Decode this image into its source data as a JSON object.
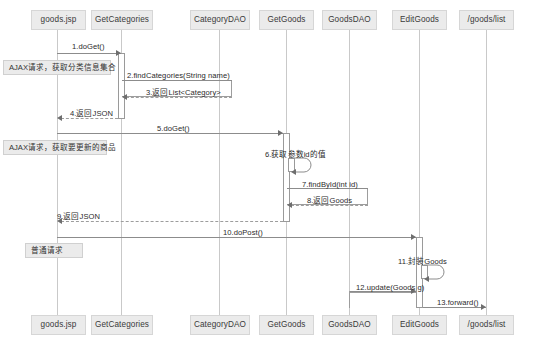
{
  "diagram": {
    "type": "uml-sequence-diagram",
    "colors": {
      "participant_fill": "#ebebeb",
      "participant_border": "#d6d6d6",
      "lifeline": "#c9c9c9",
      "message_line": "#8c8c8c",
      "note_fill": "#ebebeb",
      "background": "#ffffff"
    }
  },
  "participants": [
    {
      "id": "goods-jsp",
      "label": "goods.jsp",
      "x": 58,
      "width": 55
    },
    {
      "id": "get-categories",
      "label": "GetCategories",
      "x": 122,
      "width": 62
    },
    {
      "id": "category-dao",
      "label": "CategoryDAO",
      "x": 220,
      "width": 60
    },
    {
      "id": "get-goods",
      "label": "GetGoods",
      "x": 287,
      "width": 55
    },
    {
      "id": "goods-dao",
      "label": "GoodsDAO",
      "x": 350,
      "width": 55
    },
    {
      "id": "edit-goods",
      "label": "EditGoods",
      "x": 420,
      "width": 55
    },
    {
      "id": "goods-list",
      "label": "/goods/list",
      "x": 487,
      "width": 55
    }
  ],
  "messages": [
    {
      "seq": "1",
      "label": "1.doGet()",
      "from": "goods-jsp",
      "to": "get-categories",
      "kind": "call",
      "y": 53
    },
    {
      "seq": "2",
      "label": "2.findCategories(String name)",
      "from": "get-categories",
      "to": "category-dao",
      "kind": "call",
      "y": 80
    },
    {
      "seq": "3",
      "label": "3.返回List<Category>",
      "from": "category-dao",
      "to": "get-categories",
      "kind": "return",
      "y": 97
    },
    {
      "seq": "4",
      "label": "4.返回JSON",
      "from": "get-categories",
      "to": "goods-jsp",
      "kind": "return",
      "y": 118
    },
    {
      "seq": "5",
      "label": "5.doGet()",
      "from": "goods-jsp",
      "to": "get-goods",
      "kind": "call",
      "y": 133
    },
    {
      "seq": "6",
      "label": "6.获取参数id的值",
      "from": "get-goods",
      "to": "get-goods",
      "kind": "self",
      "y": 158
    },
    {
      "seq": "7",
      "label": "7.findById(int id)",
      "from": "get-goods",
      "to": "goods-dao",
      "kind": "call",
      "y": 188
    },
    {
      "seq": "8",
      "label": "8.返回Goods",
      "from": "goods-dao",
      "to": "get-goods",
      "kind": "return",
      "y": 205
    },
    {
      "seq": "9",
      "label": "9.返回JSON",
      "from": "get-goods",
      "to": "goods-jsp",
      "kind": "return",
      "y": 221
    },
    {
      "seq": "10",
      "label": "10.doPost()",
      "from": "goods-jsp",
      "to": "edit-goods",
      "kind": "call",
      "y": 237
    },
    {
      "seq": "11",
      "label": "11.封装Goods",
      "from": "edit-goods",
      "to": "edit-goods",
      "kind": "self",
      "y": 265
    },
    {
      "seq": "12",
      "label": "12.update(Goods g)",
      "from": "goods-dao",
      "to": "edit-goods",
      "kind": "call",
      "y": 291
    },
    {
      "seq": "13",
      "label": "13.forward()",
      "from": "edit-goods",
      "to": "goods-list",
      "kind": "call",
      "y": 307
    }
  ],
  "notes": [
    {
      "id": "note-ajax-categories",
      "label": "AJAX请求，获取分类信息集合",
      "x": 3,
      "y": 60,
      "width": 108
    },
    {
      "id": "note-ajax-goods",
      "label": "AJAX请求，获取要更新的商品",
      "x": 3,
      "y": 140,
      "width": 104
    },
    {
      "id": "note-normal-request",
      "label": "普通请求",
      "x": 25,
      "y": 243,
      "width": 58
    }
  ]
}
